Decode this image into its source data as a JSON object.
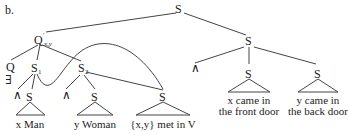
{
  "figure_label": "b.",
  "nodes": {
    "root": "S",
    "q_prime": "Q",
    "q_prime_sup": "'",
    "q_prime_sub": "x,y",
    "q": "Q",
    "exists": "∃",
    "s1": "S",
    "s1_sub": "1",
    "s2": "S",
    "s2_sub": "2",
    "and1": "∧",
    "s1_child": "S",
    "and2": "∧",
    "s2_child": "S",
    "s_met": "S",
    "right_s": "S",
    "and3": "∧",
    "right_s1": "S",
    "right_s2": "S"
  },
  "leaves": {
    "x_man": "x Man",
    "y_woman": "y Woman",
    "met": "{x,y} met in V",
    "x_came_1": "x came in",
    "x_came_2": "the front door",
    "y_came_1": "y came in",
    "y_came_2": "the back door"
  }
}
